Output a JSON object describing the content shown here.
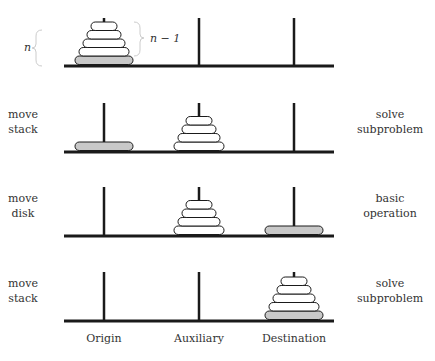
{
  "pegs": [
    "Origin",
    "Auxiliary",
    "Destination"
  ],
  "colors": {
    "ink": "#1a1a1a",
    "disk_fill": "#ffffff",
    "largest_disk_fill": "#c8c8c8",
    "text": "#333333"
  },
  "annotations": {
    "n_label": "n",
    "n_minus_1_label": "n − 1"
  },
  "rows": [
    {
      "left_label": [
        "",
        ""
      ],
      "right_label": [
        "",
        ""
      ],
      "pegs": [
        {
          "disks": [
            5,
            4,
            3,
            2,
            1
          ],
          "big_on_bottom": true
        },
        {
          "disks": []
        },
        {
          "disks": []
        }
      ]
    },
    {
      "left_label": [
        "move",
        "stack"
      ],
      "right_label": [
        "solve",
        "subproblem"
      ],
      "pegs": [
        {
          "disks": [
            5
          ],
          "big_on_bottom": true
        },
        {
          "disks": [
            4,
            3,
            2,
            1
          ]
        },
        {
          "disks": []
        }
      ]
    },
    {
      "left_label": [
        "move",
        "disk"
      ],
      "right_label": [
        "basic",
        "operation"
      ],
      "pegs": [
        {
          "disks": []
        },
        {
          "disks": [
            4,
            3,
            2,
            1
          ]
        },
        {
          "disks": [
            5
          ],
          "big_on_bottom": true
        }
      ]
    },
    {
      "left_label": [
        "move",
        "stack"
      ],
      "right_label": [
        "solve",
        "subproblem"
      ],
      "pegs": [
        {
          "disks": []
        },
        {
          "disks": []
        },
        {
          "disks": [
            5,
            4,
            3,
            2,
            1
          ],
          "big_on_bottom": true
        }
      ]
    }
  ]
}
